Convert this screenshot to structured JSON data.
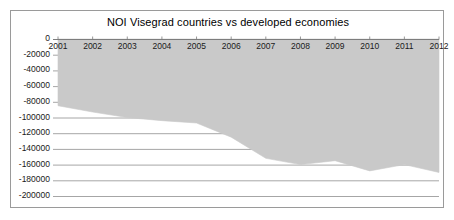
{
  "chart_data": {
    "type": "area",
    "title": "NOI Visegrad countries vs developed economies",
    "xlabel": "",
    "ylabel": "",
    "categories": [
      "2001",
      "2002",
      "2003",
      "2004",
      "2005",
      "2006",
      "2007",
      "2008",
      "2009",
      "2010",
      "2011",
      "2012"
    ],
    "x": [
      2001,
      2002,
      2003,
      2004,
      2005,
      2006,
      2007,
      2008,
      2009,
      2010,
      2011,
      2012
    ],
    "values": [
      -85000,
      -93000,
      -100000,
      -104000,
      -107000,
      -125000,
      -152000,
      -160000,
      -155000,
      -168000,
      -160000,
      -170000
    ],
    "series": [
      {
        "name": "NOI Visegrad countries vs developed economies",
        "values": [
          -85000,
          -93000,
          -100000,
          -104000,
          -107000,
          -125000,
          -152000,
          -160000,
          -155000,
          -168000,
          -160000,
          -170000
        ]
      }
    ],
    "ylim": [
      -200000,
      0
    ],
    "xlim": [
      2001,
      2012
    ],
    "yticks": [
      0,
      -20000,
      -40000,
      -60000,
      -80000,
      -100000,
      -120000,
      -140000,
      -160000,
      -180000,
      -200000
    ],
    "ytick_labels": [
      "0",
      "-20000",
      "-40000",
      "-60000",
      "-80000",
      "-100000",
      "-120000",
      "-140000",
      "-160000",
      "-180000",
      "-200000"
    ],
    "xticks": [
      2001,
      2002,
      2003,
      2004,
      2005,
      2006,
      2007,
      2008,
      2009,
      2010,
      2011,
      2012
    ],
    "xtick_labels": [
      "2001",
      "2002",
      "2003",
      "2004",
      "2005",
      "2006",
      "2007",
      "2008",
      "2009",
      "2010",
      "2011",
      "2012"
    ],
    "grid": true,
    "legend": false,
    "legend_position": "none",
    "area_color": "#c9c9c9",
    "grid_color": "#8f8f8f",
    "axis_color": "#7d7d7d",
    "text_color": "#1a1a1a"
  }
}
